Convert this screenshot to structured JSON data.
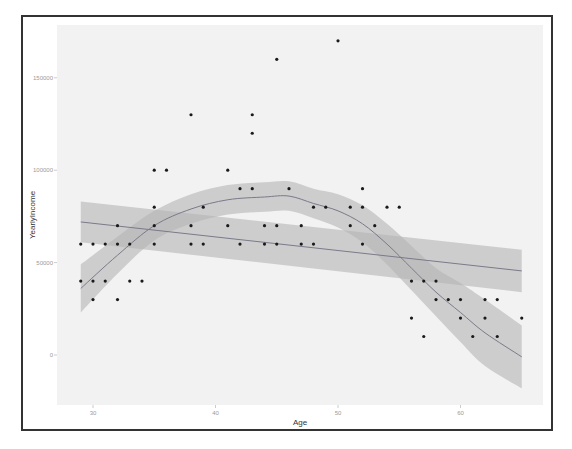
{
  "chart_data": {
    "type": "scatter",
    "title": "",
    "xlabel": "Age",
    "ylabel": "YearlyIncome",
    "xlim": [
      28,
      66
    ],
    "ylim": [
      -25000,
      178000
    ],
    "x_ticks": [
      30,
      40,
      50,
      60
    ],
    "x_tick_labels": [
      "30",
      "40",
      "50",
      "60"
    ],
    "y_ticks": [
      0,
      50000,
      100000,
      150000
    ],
    "y_tick_labels": [
      "0",
      "50000",
      "100000",
      "150000"
    ],
    "grid": false,
    "legend": "none",
    "points": [
      [
        29,
        60000
      ],
      [
        30,
        60000
      ],
      [
        31,
        60000
      ],
      [
        32,
        60000
      ],
      [
        33,
        60000
      ],
      [
        35,
        60000
      ],
      [
        38,
        60000
      ],
      [
        29,
        40000
      ],
      [
        30,
        40000
      ],
      [
        31,
        40000
      ],
      [
        33,
        40000
      ],
      [
        34,
        40000
      ],
      [
        30,
        30000
      ],
      [
        32,
        30000
      ],
      [
        32,
        70000
      ],
      [
        35,
        70000
      ],
      [
        35,
        80000
      ],
      [
        35,
        100000
      ],
      [
        36,
        100000
      ],
      [
        38,
        70000
      ],
      [
        38,
        130000
      ],
      [
        39,
        80000
      ],
      [
        39,
        60000
      ],
      [
        41,
        100000
      ],
      [
        41,
        70000
      ],
      [
        42,
        90000
      ],
      [
        42,
        60000
      ],
      [
        43,
        90000
      ],
      [
        43,
        130000
      ],
      [
        43,
        120000
      ],
      [
        44,
        70000
      ],
      [
        44,
        60000
      ],
      [
        45,
        160000
      ],
      [
        45,
        70000
      ],
      [
        45,
        60000
      ],
      [
        46,
        90000
      ],
      [
        47,
        70000
      ],
      [
        47,
        60000
      ],
      [
        48,
        80000
      ],
      [
        48,
        60000
      ],
      [
        49,
        80000
      ],
      [
        50,
        170000
      ],
      [
        51,
        80000
      ],
      [
        51,
        70000
      ],
      [
        52,
        90000
      ],
      [
        52,
        80000
      ],
      [
        52,
        60000
      ],
      [
        53,
        70000
      ],
      [
        54,
        80000
      ],
      [
        55,
        80000
      ],
      [
        56,
        40000
      ],
      [
        56,
        20000
      ],
      [
        57,
        40000
      ],
      [
        57,
        10000
      ],
      [
        58,
        40000
      ],
      [
        58,
        30000
      ],
      [
        59,
        30000
      ],
      [
        60,
        30000
      ],
      [
        60,
        20000
      ],
      [
        61,
        10000
      ],
      [
        62,
        30000
      ],
      [
        62,
        20000
      ],
      [
        63,
        30000
      ],
      [
        63,
        10000
      ],
      [
        65,
        20000
      ]
    ],
    "series": [
      {
        "name": "linear fit (lm)",
        "x": [
          29,
          65
        ],
        "y": [
          72000,
          45500
        ],
        "ci_lower": [
          61000,
          34000
        ],
        "ci_upper": [
          83000,
          57000
        ]
      },
      {
        "name": "loess fit",
        "x": [
          29,
          32,
          35,
          38,
          41,
          44,
          46,
          48,
          50,
          52,
          54,
          56,
          58,
          60,
          62,
          65
        ],
        "y": [
          36000,
          54000,
          70000,
          79000,
          84000,
          85500,
          86000,
          82000,
          78000,
          71000,
          60000,
          47000,
          34000,
          23000,
          12000,
          -1000
        ],
        "ci_lower": [
          23000,
          44000,
          62000,
          71000,
          76000,
          77500,
          78000,
          74000,
          69000,
          61000,
          49000,
          35000,
          21000,
          7000,
          -6000,
          -18000
        ],
        "ci_upper": [
          49000,
          64000,
          78000,
          87000,
          92000,
          93500,
          94000,
          90000,
          87000,
          81000,
          71000,
          59000,
          47000,
          39000,
          30000,
          16000
        ]
      }
    ]
  },
  "style": {
    "panel_bg": "#f2f2f2",
    "point_color": "#1a1a1a",
    "line_color": "#7a7a8a",
    "ribbon_color": "#b4b4b4",
    "frame_color": "#333333"
  }
}
